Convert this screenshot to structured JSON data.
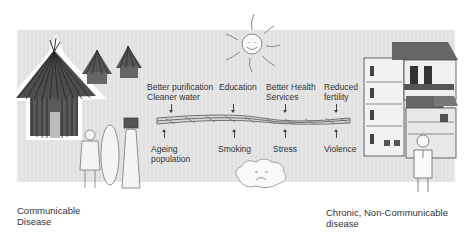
{
  "diagram": {
    "rope_factors_above": [
      {
        "label": "Better purification\nCleaner water"
      },
      {
        "label": "Education"
      },
      {
        "label": "Better Health\nServices"
      },
      {
        "label": "Reduced\nfertility"
      }
    ],
    "rope_factors_below": [
      {
        "label": "Ageing\npopulation"
      },
      {
        "label": "Smoking"
      },
      {
        "label": "Stress"
      },
      {
        "label": "Violence"
      }
    ],
    "left_caption": "Communicable\nDisease",
    "right_caption": "Chronic, Non-Communicable\ndisease",
    "illustrations": {
      "left": "thatched-huts-and-villagers",
      "right": "multi-storey-urban-houses-and-man",
      "top": "smiling-sun",
      "bottom": "sad-cloud",
      "center": "rope"
    },
    "colors": {
      "panel": "#e4e4e4",
      "ink": "#333333",
      "background": "#ffffff"
    }
  }
}
